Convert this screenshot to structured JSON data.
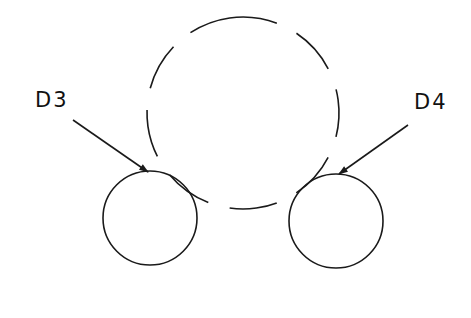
{
  "diagram": {
    "background": "#ffffff",
    "stroke_color": "#1a1a1a",
    "large_circle": {
      "cx": 243,
      "cy": 113,
      "r": 96,
      "style": "dashed"
    },
    "small_circles": [
      {
        "id": "D3",
        "cx": 150,
        "cy": 218,
        "r": 47
      },
      {
        "id": "D4",
        "cx": 336,
        "cy": 221,
        "r": 47
      }
    ],
    "labels": [
      {
        "text": "D3",
        "x": 35,
        "y": 88
      },
      {
        "text": "D4",
        "x": 414,
        "y": 90
      }
    ],
    "leaders": [
      {
        "from": [
          73,
          120
        ],
        "to": [
          148,
          172
        ]
      },
      {
        "from": [
          408,
          125
        ],
        "to": [
          339,
          174
        ]
      }
    ]
  }
}
